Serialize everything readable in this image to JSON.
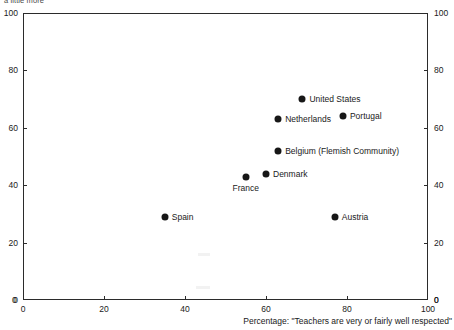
{
  "top_caption": "a little more",
  "axis": {
    "x_title": "Percentage: \"Teachers are very or fairly well respected\"",
    "x_ticks": [
      "0",
      "20",
      "40",
      "60",
      "80",
      "100"
    ],
    "y_ticks": [
      "0",
      "20",
      "40",
      "60",
      "80",
      "100"
    ],
    "corner_zero_left": "0",
    "corner_zero_right": "0"
  },
  "chart_data": {
    "type": "scatter",
    "title": "",
    "xlabel": "Percentage: \"Teachers are very or fairly well respected\"",
    "ylabel": "",
    "xlim": [
      0,
      100
    ],
    "ylim": [
      0,
      100
    ],
    "xticks": [
      0,
      20,
      40,
      60,
      80,
      100
    ],
    "yticks": [
      0,
      20,
      40,
      60,
      80,
      100
    ],
    "grid": false,
    "legend": "none",
    "marker_color": "#171717",
    "points": [
      {
        "label": "United States",
        "x": 69,
        "y": 70,
        "label_pos": "right"
      },
      {
        "label": "Portugal",
        "x": 79,
        "y": 64,
        "label_pos": "right"
      },
      {
        "label": "Netherlands",
        "x": 63,
        "y": 63,
        "label_pos": "right"
      },
      {
        "label": "Belgium (Flemish Community)",
        "x": 63,
        "y": 52,
        "label_pos": "right"
      },
      {
        "label": "Denmark",
        "x": 60,
        "y": 44,
        "label_pos": "right"
      },
      {
        "label": "France",
        "x": 55,
        "y": 43,
        "label_pos": "below"
      },
      {
        "label": "Spain",
        "x": 35,
        "y": 29,
        "label_pos": "right"
      },
      {
        "label": "Austria",
        "x": 77,
        "y": 29,
        "label_pos": "right"
      }
    ]
  }
}
